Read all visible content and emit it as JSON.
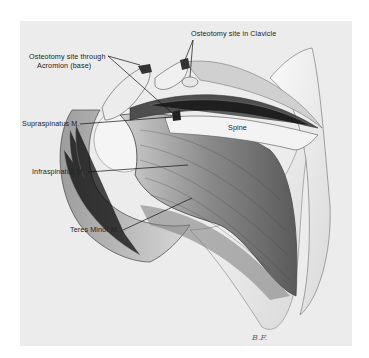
{
  "figure": {
    "type": "anatomical illustration",
    "colors": {
      "background": "#ececec",
      "page": "#ffffff",
      "ink": "#222222",
      "bone": "#f4f4f4",
      "muscle_dark": "#555555",
      "muscle_mid": "#9a9a9a"
    }
  },
  "labels": {
    "clavicle": "Osteotomy site in Clavicle",
    "acromion_line1": "Osteotomy site through",
    "acromion_line2": "Acromion (base)",
    "supraspinatus": "Supraspinatus M.",
    "spine": "Spine",
    "infraspinatus": "Infraspinatus M.",
    "teres_minor": "Teres Minor M."
  },
  "signature": "B.F."
}
